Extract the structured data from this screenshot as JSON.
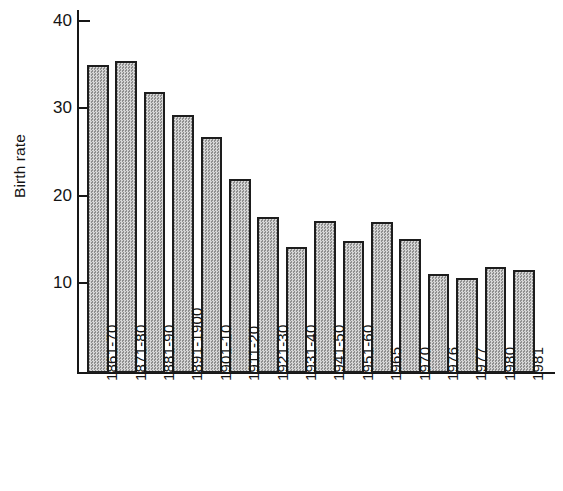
{
  "chart_data": {
    "type": "bar",
    "title": "",
    "subtitle": "",
    "xlabel": "",
    "ylabel": "Birth rate",
    "ylim": [
      0,
      42
    ],
    "yticks": [
      10,
      20,
      30,
      40
    ],
    "grid": false,
    "legend": false,
    "categories": [
      "1861-70",
      "1871-80",
      "1881-90",
      "1891-1900",
      "1901-10",
      "1911-20",
      "1921-30",
      "1931-40",
      "1941-50",
      "1951-60",
      "1965",
      "1970",
      "1976",
      "1977",
      "1980",
      "1981"
    ],
    "values": [
      35.0,
      35.5,
      32.0,
      29.3,
      26.8,
      22.0,
      17.7,
      14.2,
      17.2,
      14.9,
      17.1,
      15.2,
      11.1,
      10.7,
      12.0,
      11.6
    ],
    "bar_fill": "#b9b9b9",
    "bar_edge": "#1d1d1d",
    "axis_color": "#171717",
    "background": "#ffffff"
  }
}
